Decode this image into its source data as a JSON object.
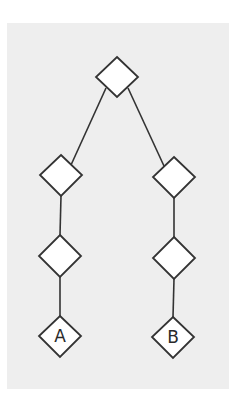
{
  "diagram": {
    "type": "tree",
    "background_color": "#eeeeee",
    "stroke_color": "#333333",
    "node_fill": "#ffffff",
    "nodes": [
      {
        "id": "root",
        "label": "",
        "cx": 117,
        "cy": 77
      },
      {
        "id": "left-1",
        "label": "",
        "cx": 61,
        "cy": 175
      },
      {
        "id": "right-1",
        "label": "",
        "cx": 174,
        "cy": 177
      },
      {
        "id": "left-2",
        "label": "",
        "cx": 60,
        "cy": 256
      },
      {
        "id": "right-2",
        "label": "",
        "cx": 174,
        "cy": 258
      },
      {
        "id": "leaf-a",
        "label": "A",
        "cx": 60,
        "cy": 336
      },
      {
        "id": "leaf-b",
        "label": "B",
        "cx": 173,
        "cy": 337
      }
    ],
    "edges": [
      {
        "from": "root",
        "to": "left-1"
      },
      {
        "from": "root",
        "to": "right-1"
      },
      {
        "from": "left-1",
        "to": "left-2"
      },
      {
        "from": "right-1",
        "to": "right-2"
      },
      {
        "from": "left-2",
        "to": "leaf-a"
      },
      {
        "from": "right-2",
        "to": "leaf-b"
      }
    ]
  }
}
